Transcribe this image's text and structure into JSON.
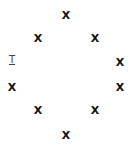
{
  "marks": [
    {
      "label": "X",
      "x": 66,
      "y": 15
    },
    {
      "label": "X",
      "x": 38,
      "y": 38
    },
    {
      "label": "X",
      "x": 95,
      "y": 38
    },
    {
      "label": "X",
      "x": 120,
      "y": 62
    },
    {
      "label": "X",
      "x": 12,
      "y": 87
    },
    {
      "label": "X",
      "x": 120,
      "y": 87
    },
    {
      "label": "X",
      "x": 38,
      "y": 110
    },
    {
      "label": "X",
      "x": 95,
      "y": 110
    },
    {
      "label": "X",
      "x": 66,
      "y": 135
    }
  ],
  "text_cursor": {
    "label": "T",
    "x": 12,
    "y": 60
  }
}
